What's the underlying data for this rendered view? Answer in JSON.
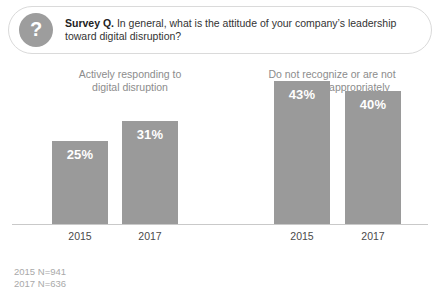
{
  "header": {
    "icon": "question-mark-icon",
    "label_bold": "Survey Q.",
    "question": " In general, what is the attitude of your company’s leadership toward digital disruption?"
  },
  "colors": {
    "bar": "#9a9a9a",
    "icon_circle": "#9d9d9d",
    "group_title": "#8c8c8c",
    "baseline": "#c9c9c9",
    "footer": "#a9a9a9",
    "value_label": "#ffffff"
  },
  "groups": [
    {
      "title": "Actively responding to\ndigital disruption",
      "bars": [
        {
          "year": "2015",
          "value": "25%"
        },
        {
          "year": "2017",
          "value": "31%"
        }
      ]
    },
    {
      "title": "Do not recognize or are not\nresponding appropriately",
      "bars": [
        {
          "year": "2015",
          "value": "43%"
        },
        {
          "year": "2017",
          "value": "40%"
        }
      ]
    }
  ],
  "footer": {
    "line1": "2015 N=941",
    "line2": "2017 N=636"
  },
  "chart_data": {
    "type": "bar",
    "title": "Survey Q. In general, what is the attitude of your company’s leadership toward digital disruption?",
    "xlabel": "",
    "ylabel": "",
    "ylim": [
      0,
      50
    ],
    "grid": false,
    "legend": "none",
    "categories": [
      "2015",
      "2017"
    ],
    "groups": [
      {
        "name": "Actively responding to digital disruption",
        "categories": [
          "2015",
          "2017"
        ],
        "values": [
          25,
          31
        ],
        "labels": [
          "25%",
          "31%"
        ]
      },
      {
        "name": "Do not recognize or are not responding appropriately",
        "categories": [
          "2015",
          "2017"
        ],
        "values": [
          43,
          40
        ],
        "labels": [
          "43%",
          "40%"
        ]
      }
    ],
    "annotations": [
      "2015 N=941",
      "2017 N=636"
    ]
  }
}
